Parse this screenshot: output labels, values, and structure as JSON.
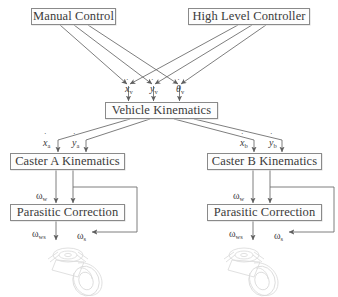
{
  "diagram": {
    "width": 338,
    "height": 297,
    "line_color": "#6f6f6f",
    "box_border_color": "#8a8a8a",
    "text_color": "#3a3a3a",
    "background": "#ffffff"
  },
  "blocks": {
    "manual_control": {
      "label": "Manual Control",
      "x": 31,
      "y": 8,
      "w": 85,
      "h": 17
    },
    "high_level_controller": {
      "label": "High Level Controller",
      "x": 188,
      "y": 8,
      "w": 122,
      "h": 17
    },
    "vehicle_kinematics": {
      "label": "Vehicle Kinematics",
      "x": 105,
      "y": 102,
      "w": 113,
      "h": 17
    },
    "caster_a_kinematics": {
      "label": "Caster A Kinematics",
      "x": 10,
      "y": 153,
      "w": 115,
      "h": 17
    },
    "caster_b_kinematics": {
      "label": "Caster B Kinematics",
      "x": 207,
      "y": 153,
      "w": 115,
      "h": 17
    },
    "parasitic_correction_a": {
      "label": "Parasitic Correction",
      "x": 10,
      "y": 204,
      "w": 115,
      "h": 17
    },
    "parasitic_correction_b": {
      "label": "Parasitic Correction",
      "x": 207,
      "y": 204,
      "w": 115,
      "h": 17
    }
  },
  "signals": {
    "vehicle_inputs": [
      {
        "name": "x-dot-v",
        "base": "x",
        "sub": "v",
        "dot": true,
        "x": 125,
        "y": 84
      },
      {
        "name": "y-dot-v",
        "base": "y",
        "sub": "v",
        "dot": true,
        "x": 150,
        "y": 84
      },
      {
        "name": "theta-dot-v",
        "base": "θ",
        "sub": "v",
        "dot": true,
        "x": 176,
        "y": 84
      }
    ],
    "caster_a_inputs": [
      {
        "name": "x-dot-a",
        "base": "x",
        "sub": "a",
        "dot": true,
        "x": 43,
        "y": 138
      },
      {
        "name": "y-dot-a",
        "base": "y",
        "sub": "a",
        "dot": true,
        "x": 72,
        "y": 138
      }
    ],
    "caster_b_inputs": [
      {
        "name": "x-dot-b",
        "base": "x",
        "sub": "b",
        "dot": true,
        "x": 240,
        "y": 138
      },
      {
        "name": "y-dot-b",
        "base": "y",
        "sub": "b",
        "dot": true,
        "x": 269,
        "y": 138
      }
    ],
    "parasitic_a_input": {
      "name": "omega-w",
      "base": "ω",
      "sub": "w",
      "dot": false,
      "x": 36,
      "y": 191
    },
    "parasitic_b_input": {
      "name": "omega-w",
      "base": "ω",
      "sub": "w",
      "dot": false,
      "x": 233,
      "y": 191
    },
    "parasitic_a_outputs": [
      {
        "name": "omega-ws",
        "base": "ω",
        "sub": "ws",
        "dot": false,
        "x": 32,
        "y": 229
      },
      {
        "name": "omega-s",
        "base": "ω",
        "sub": "s",
        "dot": false,
        "x": 77,
        "y": 231
      }
    ],
    "parasitic_b_outputs": [
      {
        "name": "omega-ws",
        "base": "ω",
        "sub": "ws",
        "dot": false,
        "x": 229,
        "y": 229
      },
      {
        "name": "omega-s",
        "base": "ω",
        "sub": "s",
        "dot": false,
        "x": 274,
        "y": 231
      }
    ]
  },
  "wheels": [
    {
      "name": "caster-wheel-a",
      "x": 28,
      "y": 243,
      "w": 104,
      "h": 54
    },
    {
      "name": "caster-wheel-b",
      "x": 204,
      "y": 243,
      "w": 104,
      "h": 54
    }
  ]
}
